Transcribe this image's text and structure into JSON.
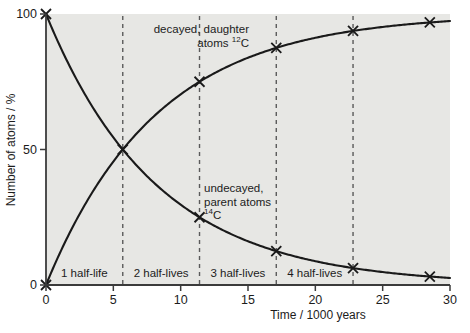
{
  "chart_data": {
    "type": "line",
    "title": "",
    "subtitle": "",
    "xlabel": "Time / 1000 years",
    "ylabel": "Number of atoms / %",
    "xlim": [
      0,
      30
    ],
    "ylim": [
      0,
      100
    ],
    "xticks": [
      0,
      5,
      10,
      15,
      20,
      25,
      30
    ],
    "xticklabels": [
      "0",
      "5",
      "10",
      "15",
      "20",
      "25",
      "30"
    ],
    "yticks": [
      0,
      50,
      100
    ],
    "yticklabels": [
      "0",
      "50",
      "100"
    ],
    "grid": false,
    "legend_position": "inline-annotations",
    "marker": "x",
    "half_life_years": 5.7,
    "series": [
      {
        "name": "decayed, daughter atoms 12C",
        "label_text": "decayed, daughter",
        "label_text2": "atoms",
        "label_isotope_sup": "12",
        "label_isotope_el": "C",
        "curve": "rising exponential approach to 100%",
        "x": [
          0,
          5.7,
          11.4,
          17.1,
          22.8,
          28.5
        ],
        "y": [
          0,
          50,
          75,
          87.5,
          93.75,
          96.9
        ],
        "marked_points": [
          {
            "x": 11.4,
            "y": 75
          },
          {
            "x": 17.1,
            "y": 87.5
          },
          {
            "x": 22.8,
            "y": 93.75
          },
          {
            "x": 28.5,
            "y": 96.9
          }
        ]
      },
      {
        "name": "undecayed, parent atoms 14C",
        "label_text": "undecayed,",
        "label_text2": "parent atoms",
        "label_isotope_sup": "14",
        "label_isotope_el": "C",
        "curve": "decaying exponential from 100%",
        "x": [
          0,
          5.7,
          11.4,
          17.1,
          22.8,
          28.5
        ],
        "y": [
          100,
          50,
          25,
          12.5,
          6.25,
          3.1
        ],
        "marked_points": [
          {
            "x": 0,
            "y": 100
          },
          {
            "x": 11.4,
            "y": 25
          },
          {
            "x": 17.1,
            "y": 12.5
          },
          {
            "x": 22.8,
            "y": 6.25
          },
          {
            "x": 28.5,
            "y": 3.1
          }
        ]
      }
    ],
    "half_life_bands": [
      {
        "label": "1 half-life",
        "from": 0,
        "to": 5.7
      },
      {
        "label": "2 half-lives",
        "from": 5.7,
        "to": 11.4
      },
      {
        "label": "3 half-lives",
        "from": 11.4,
        "to": 17.1
      },
      {
        "label": "4 half-lives",
        "from": 17.1,
        "to": 22.8
      }
    ],
    "dashed_verticals": [
      5.7,
      11.4,
      17.1,
      22.8
    ],
    "annotations": [
      {
        "name": "decayed-label",
        "x": 12.6,
        "y": 82
      },
      {
        "name": "undecayed-label",
        "x": 12.6,
        "y": 38
      }
    ],
    "colors": {
      "plot_background": "#e7e7e4",
      "page_background": "#ffffff",
      "axis": "#3b3b3b",
      "curve": "#1a1a1a",
      "dashed": "#5a5a5a",
      "text": "#1c1c1c"
    }
  }
}
